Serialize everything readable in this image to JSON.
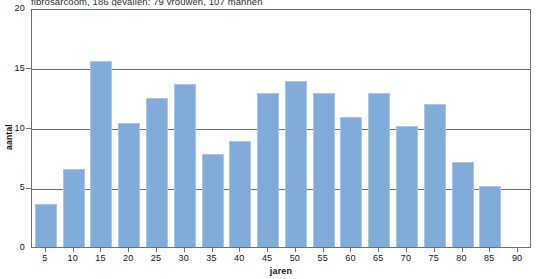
{
  "caption": "fibrosarcoom, 186 gevallen: 79 vrouwen, 107 mannen",
  "chart_data": {
    "type": "bar",
    "title": "fibrosarcoom, 186 gevallen: 79 vrouwen, 107 mannen",
    "xlabel": "jaren",
    "ylabel": "aantal",
    "categories": [
      "5",
      "10",
      "15",
      "20",
      "25",
      "30",
      "35",
      "40",
      "45",
      "50",
      "55",
      "60",
      "65",
      "70",
      "75",
      "80",
      "85",
      "90"
    ],
    "values": [
      3.6,
      6.5,
      15.6,
      10.4,
      12.5,
      13.6,
      7.8,
      8.9,
      12.9,
      13.9,
      12.9,
      10.9,
      12.9,
      10.1,
      12.0,
      7.1,
      5.1,
      0
    ],
    "ylim": [
      0,
      20
    ],
    "yticks": [
      "0",
      "5",
      "10",
      "15",
      "20"
    ],
    "ytick_values": [
      0,
      5,
      10,
      15,
      20
    ],
    "grid": true,
    "legend": false,
    "bar_color": "#81abd9",
    "bar_edge_color": "#a9c6e6",
    "axis_color": "#6f6f6f"
  }
}
